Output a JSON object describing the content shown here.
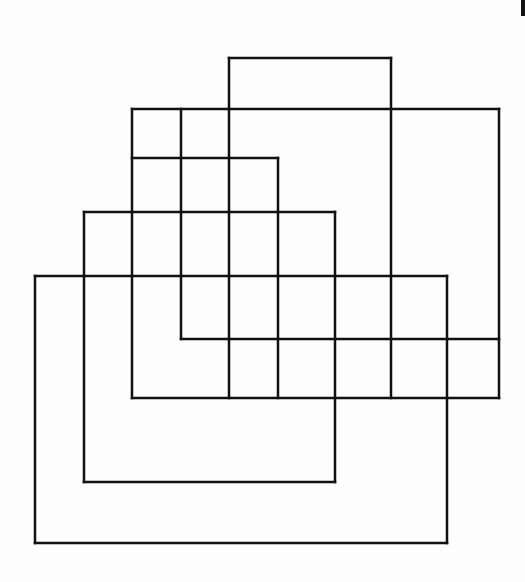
{
  "diagram": {
    "stroke_color": "#111111",
    "stroke_width": 2.5,
    "background": "#fdfdfd",
    "rectangles": [
      {
        "name": "top-tall-rect",
        "x1": 229,
        "y1": 58,
        "x2": 391,
        "y2": 339
      },
      {
        "name": "wide-right-rect",
        "x1": 132,
        "y1": 109,
        "x2": 499,
        "y2": 398
      },
      {
        "name": "small-upper-left-rect",
        "x1": 132,
        "y1": 109,
        "x2": 181,
        "y2": 276
      },
      {
        "name": "second-left-col",
        "x1": 181,
        "y1": 109,
        "x2": 499,
        "y2": 339
      },
      {
        "name": "step-rect",
        "x1": 132,
        "y1": 158,
        "x2": 278,
        "y2": 276
      },
      {
        "name": "mid-rect",
        "x1": 84,
        "y1": 212,
        "x2": 335,
        "y2": 482
      },
      {
        "name": "big-bottom-rect",
        "x1": 35,
        "y1": 276,
        "x2": 447,
        "y2": 543
      }
    ],
    "lines": [
      {
        "x1": 229,
        "y1": 58,
        "x2": 391,
        "y2": 58
      },
      {
        "x1": 229,
        "y1": 58,
        "x2": 229,
        "y2": 398
      },
      {
        "x1": 391,
        "y1": 58,
        "x2": 391,
        "y2": 398
      },
      {
        "x1": 132,
        "y1": 109,
        "x2": 499,
        "y2": 109
      },
      {
        "x1": 132,
        "y1": 109,
        "x2": 132,
        "y2": 398
      },
      {
        "x1": 181,
        "y1": 109,
        "x2": 181,
        "y2": 339
      },
      {
        "x1": 499,
        "y1": 109,
        "x2": 499,
        "y2": 398
      },
      {
        "x1": 132,
        "y1": 158,
        "x2": 278,
        "y2": 158
      },
      {
        "x1": 278,
        "y1": 158,
        "x2": 278,
        "y2": 398
      },
      {
        "x1": 84,
        "y1": 212,
        "x2": 335,
        "y2": 212
      },
      {
        "x1": 84,
        "y1": 212,
        "x2": 84,
        "y2": 482
      },
      {
        "x1": 335,
        "y1": 212,
        "x2": 335,
        "y2": 482
      },
      {
        "x1": 35,
        "y1": 276,
        "x2": 447,
        "y2": 276
      },
      {
        "x1": 35,
        "y1": 276,
        "x2": 35,
        "y2": 543
      },
      {
        "x1": 447,
        "y1": 276,
        "x2": 447,
        "y2": 543
      },
      {
        "x1": 181,
        "y1": 339,
        "x2": 499,
        "y2": 339
      },
      {
        "x1": 132,
        "y1": 398,
        "x2": 499,
        "y2": 398
      },
      {
        "x1": 84,
        "y1": 482,
        "x2": 335,
        "y2": 482
      },
      {
        "x1": 35,
        "y1": 543,
        "x2": 447,
        "y2": 543
      }
    ]
  }
}
